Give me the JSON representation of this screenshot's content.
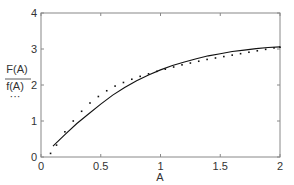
{
  "chart_data": {
    "type": "line",
    "title": "",
    "xlabel": "A",
    "ylabel_numerator": "F(A)",
    "ylabel_denominator": "f(A)",
    "ylabel_legend_glyph": "···",
    "xlim": [
      0,
      2
    ],
    "ylim": [
      0,
      4
    ],
    "xticks": [
      0,
      0.5,
      1,
      1.5,
      2
    ],
    "xtick_labels": [
      "0",
      "0.5",
      "1",
      "1.5",
      "2"
    ],
    "yticks": [
      0,
      1,
      2,
      3,
      4
    ],
    "ytick_labels": [
      "0",
      "1",
      "2",
      "3",
      "4"
    ],
    "grid": false,
    "series": [
      {
        "name": "F(A)/f(A)",
        "style": "solid",
        "x": [
          0.1,
          0.2,
          0.3,
          0.4,
          0.5,
          0.6,
          0.7,
          0.8,
          0.9,
          1.0,
          1.1,
          1.2,
          1.3,
          1.4,
          1.5,
          1.6,
          1.7,
          1.8,
          1.9,
          2.0
        ],
        "y": [
          0.3,
          0.62,
          0.93,
          1.2,
          1.47,
          1.72,
          1.93,
          2.12,
          2.28,
          2.42,
          2.54,
          2.64,
          2.73,
          2.81,
          2.87,
          2.93,
          2.97,
          3.01,
          3.04,
          3.06
        ]
      },
      {
        "name": "dotted",
        "style": "dotted",
        "x": [
          0.08,
          0.13,
          0.2,
          0.27,
          0.34,
          0.41,
          0.48,
          0.55,
          0.62,
          0.69,
          0.76,
          0.83,
          0.9,
          0.97,
          1.04,
          1.11,
          1.18,
          1.25,
          1.32,
          1.39,
          1.46,
          1.53,
          1.6,
          1.67,
          1.74,
          1.81,
          1.88,
          1.95,
          2.0
        ],
        "y": [
          0.1,
          0.33,
          0.7,
          1.0,
          1.27,
          1.5,
          1.68,
          1.84,
          1.97,
          2.07,
          2.16,
          2.24,
          2.31,
          2.38,
          2.44,
          2.5,
          2.56,
          2.61,
          2.66,
          2.71,
          2.75,
          2.79,
          2.83,
          2.87,
          2.91,
          2.95,
          2.99,
          3.03,
          3.05
        ]
      }
    ]
  }
}
